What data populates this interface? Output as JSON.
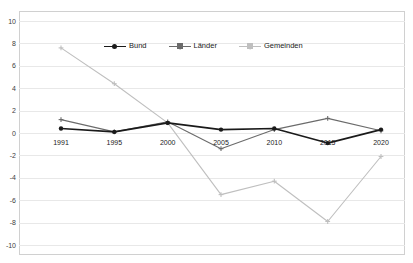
{
  "chart_data": {
    "type": "line",
    "title": "",
    "subtitle": "",
    "xlabel": "",
    "ylabel": "",
    "categories": [
      "1991",
      "1995",
      "2000",
      "2005",
      "2010",
      "2015",
      "2020"
    ],
    "ylim": [
      -10,
      10
    ],
    "ytick_step": 2,
    "yticks": [
      "10",
      "8",
      "6",
      "4",
      "2",
      "0",
      "-2",
      "-4",
      "-6",
      "-8",
      "-10"
    ],
    "ytick_values": [
      10,
      8,
      6,
      4,
      2,
      0,
      -2,
      -4,
      -6,
      -8,
      -10
    ],
    "grid": "horizontal",
    "legend_position": "top-center-inside",
    "series": [
      {
        "name": "Bund",
        "color": "#1a1a1a",
        "marker": "circle",
        "values": [
          0.4,
          0.1,
          0.9,
          0.3,
          0.4,
          -0.9,
          0.3
        ]
      },
      {
        "name": "Länder",
        "color": "#6b6b6b",
        "marker": "cross",
        "values": [
          1.2,
          0.1,
          1.0,
          -1.4,
          0.3,
          1.3,
          0.2
        ]
      },
      {
        "name": "Gemeinden",
        "color": "#bfbfbf",
        "marker": "cross",
        "values": [
          7.6,
          4.4,
          0.9,
          -5.5,
          -4.3,
          -7.9,
          -2.1
        ]
      }
    ]
  },
  "legend": {
    "items": [
      {
        "label": "Bund"
      },
      {
        "label": "Länder"
      },
      {
        "label": "Gemeinden"
      }
    ]
  },
  "colors": {
    "bund": "#1a1a1a",
    "laender": "#6b6b6b",
    "gemeinden": "#bfbfbf",
    "grid": "#e8e8e8",
    "frame": "#d0d0d0",
    "background": "#ffffff"
  }
}
